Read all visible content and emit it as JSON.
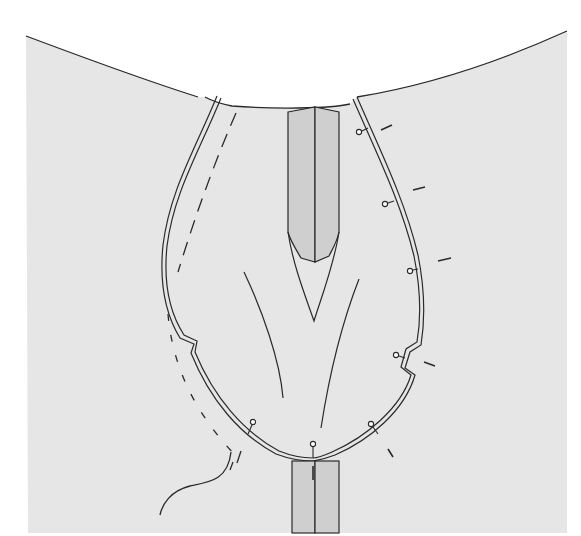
{
  "figure": {
    "kind": "sewing-illustration",
    "colors": {
      "page": "#ffffff",
      "fabric": "#e6e6e6",
      "strip": "#cfcfcf",
      "line": "#2a2a2a",
      "pin_head": "#ffffff"
    },
    "caption_cropped": ""
  }
}
